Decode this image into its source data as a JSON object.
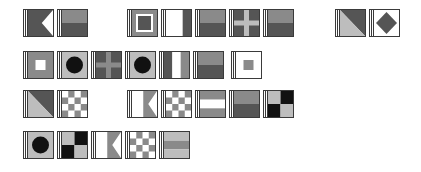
{
  "colors": {
    "dark": "#555555",
    "mid": "#8a8a8a",
    "light": "#bdbdbd",
    "white": "#ffffff",
    "black": "#111111",
    "border": "#3a3a3a"
  },
  "rows": [
    {
      "flags": [
        {
          "id": "r1-1",
          "pattern": "swallowtail",
          "x": 23,
          "y": 9,
          "colors": [
            "dark"
          ]
        },
        {
          "id": "r1-2",
          "pattern": "hbands2",
          "x": 57,
          "y": 9,
          "colors": [
            "mid",
            "dark"
          ]
        },
        {
          "id": "r1-3",
          "pattern": "nested-squares",
          "x": 127,
          "y": 9,
          "colors": [
            "mid",
            "white",
            "dark"
          ]
        },
        {
          "id": "r1-4",
          "pattern": "vbands3",
          "x": 161,
          "y": 9,
          "colors": [
            "white",
            "white",
            "dark"
          ]
        },
        {
          "id": "r1-5",
          "pattern": "hbands2",
          "x": 195,
          "y": 9,
          "colors": [
            "mid",
            "dark"
          ]
        },
        {
          "id": "r1-6",
          "pattern": "cross",
          "x": 229,
          "y": 9,
          "colors": [
            "dark",
            "light"
          ]
        },
        {
          "id": "r1-7",
          "pattern": "hbands2",
          "x": 263,
          "y": 9,
          "colors": [
            "mid",
            "dark"
          ]
        },
        {
          "id": "r1-8",
          "pattern": "diagonal",
          "x": 335,
          "y": 9,
          "colors": [
            "dark",
            "light"
          ]
        },
        {
          "id": "r1-9",
          "pattern": "diamond",
          "x": 369,
          "y": 9,
          "colors": [
            "white",
            "dark"
          ]
        }
      ]
    },
    {
      "flags": [
        {
          "id": "r2-1",
          "pattern": "center-square",
          "x": 23,
          "y": 51,
          "colors": [
            "mid",
            "white"
          ]
        },
        {
          "id": "r2-2",
          "pattern": "circle",
          "x": 57,
          "y": 51,
          "colors": [
            "light",
            "black"
          ]
        },
        {
          "id": "r2-3",
          "pattern": "cross",
          "x": 91,
          "y": 51,
          "colors": [
            "dark",
            "mid"
          ]
        },
        {
          "id": "r2-4",
          "pattern": "circle",
          "x": 125,
          "y": 51,
          "colors": [
            "light",
            "black"
          ]
        },
        {
          "id": "r2-5",
          "pattern": "vbands3",
          "x": 159,
          "y": 51,
          "colors": [
            "dark",
            "white",
            "mid"
          ]
        },
        {
          "id": "r2-6",
          "pattern": "hbands2",
          "x": 193,
          "y": 51,
          "colors": [
            "mid",
            "dark"
          ]
        },
        {
          "id": "r2-7",
          "pattern": "center-square",
          "x": 231,
          "y": 51,
          "colors": [
            "white",
            "mid"
          ]
        }
      ]
    },
    {
      "flags": [
        {
          "id": "r3-1",
          "pattern": "diagonal",
          "x": 23,
          "y": 90,
          "colors": [
            "dark",
            "light"
          ]
        },
        {
          "id": "r3-2",
          "pattern": "checker",
          "x": 57,
          "y": 90,
          "colors": [
            "white",
            "mid"
          ]
        },
        {
          "id": "r3-3",
          "pattern": "swallowtail-split",
          "x": 127,
          "y": 90,
          "colors": [
            "white",
            "mid"
          ]
        },
        {
          "id": "r3-4",
          "pattern": "checker",
          "x": 161,
          "y": 90,
          "colors": [
            "white",
            "mid"
          ]
        },
        {
          "id": "r3-5",
          "pattern": "hbands3",
          "x": 195,
          "y": 90,
          "colors": [
            "mid",
            "white",
            "mid"
          ]
        },
        {
          "id": "r3-6",
          "pattern": "hbands2",
          "x": 229,
          "y": 90,
          "colors": [
            "mid",
            "dark"
          ]
        },
        {
          "id": "r3-7",
          "pattern": "quarters",
          "x": 263,
          "y": 90,
          "colors": [
            "light",
            "black"
          ]
        }
      ]
    },
    {
      "flags": [
        {
          "id": "r4-1",
          "pattern": "circle",
          "x": 23,
          "y": 131,
          "colors": [
            "light",
            "black"
          ]
        },
        {
          "id": "r4-2",
          "pattern": "quarters",
          "x": 57,
          "y": 131,
          "colors": [
            "light",
            "black"
          ]
        },
        {
          "id": "r4-3",
          "pattern": "swallowtail-split",
          "x": 91,
          "y": 131,
          "colors": [
            "white",
            "mid"
          ]
        },
        {
          "id": "r4-4",
          "pattern": "checker",
          "x": 125,
          "y": 131,
          "colors": [
            "white",
            "mid"
          ]
        },
        {
          "id": "r4-5",
          "pattern": "hbands3",
          "x": 159,
          "y": 131,
          "colors": [
            "light",
            "mid",
            "light"
          ]
        }
      ]
    }
  ]
}
